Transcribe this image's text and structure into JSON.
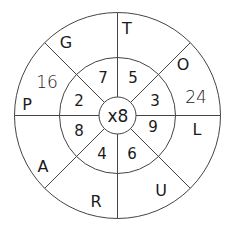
{
  "diagram": {
    "type": "multiplication-wheel",
    "center_label": "x8",
    "inner_ring": [
      {
        "position": "top-right",
        "value": "5"
      },
      {
        "position": "right-top",
        "value": "3"
      },
      {
        "position": "right-bottom",
        "value": "9"
      },
      {
        "position": "bottom-right",
        "value": "6"
      },
      {
        "position": "bottom-left",
        "value": "4"
      },
      {
        "position": "left-bottom",
        "value": "8"
      },
      {
        "position": "left-top",
        "value": "2"
      },
      {
        "position": "top-left",
        "value": "7"
      }
    ],
    "outer_ring": [
      {
        "position": "top-right",
        "letter": "T",
        "answer": ""
      },
      {
        "position": "right-top",
        "letter": "O",
        "answer": "24"
      },
      {
        "position": "right-bottom",
        "letter": "L",
        "answer": ""
      },
      {
        "position": "bottom-right",
        "letter": "U",
        "answer": ""
      },
      {
        "position": "bottom-left",
        "letter": "R",
        "answer": ""
      },
      {
        "position": "left-bottom",
        "letter": "A",
        "answer": ""
      },
      {
        "position": "left-top",
        "letter": "P",
        "answer": "16"
      },
      {
        "position": "top-left",
        "letter": "G",
        "answer": ""
      }
    ],
    "colors": {
      "line": "#444444",
      "text": "#1a1a1a",
      "background": "#ffffff"
    }
  }
}
